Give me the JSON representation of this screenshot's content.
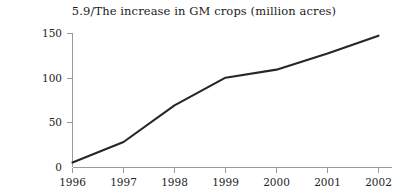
{
  "chart_data": {
    "type": "line",
    "title": "5.9/The increase in GM crops (million acres)",
    "xlabel": "",
    "ylabel": "",
    "categories": [
      "1996",
      "1997",
      "1998",
      "1999",
      "2000",
      "2001",
      "2002"
    ],
    "x": [
      1996,
      1997,
      1998,
      1999,
      2000,
      2001,
      2002
    ],
    "values": [
      5,
      28,
      69,
      100,
      109,
      127,
      147
    ],
    "series": [
      {
        "name": "GM crops (million acres)",
        "values": [
          5,
          28,
          69,
          100,
          109,
          127,
          147
        ]
      }
    ],
    "ylim": [
      0,
      150
    ],
    "yticks": [
      0,
      50,
      100,
      150
    ],
    "ytick_labels": [
      "0",
      "50",
      "100",
      "150"
    ],
    "xtick_labels": [
      "1996",
      "1997",
      "1998",
      "1999",
      "2000",
      "2001",
      "2002"
    ],
    "grid": false,
    "legend": false,
    "line_color": "#262626",
    "axis_color": "#9a9a9a"
  }
}
